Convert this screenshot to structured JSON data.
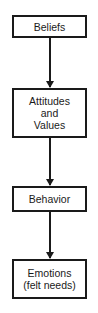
{
  "diagram": {
    "type": "flowchart",
    "direction": "top-to-bottom",
    "nodes": [
      {
        "id": "beliefs",
        "lines": [
          "Beliefs"
        ]
      },
      {
        "id": "attitudes-values",
        "lines": [
          "Attitudes",
          "and",
          "Values"
        ]
      },
      {
        "id": "behavior",
        "lines": [
          "Behavior"
        ]
      },
      {
        "id": "emotions",
        "lines": [
          "Emotions",
          "(felt needs)"
        ]
      }
    ],
    "edges": [
      {
        "from": "beliefs",
        "to": "attitudes-values"
      },
      {
        "from": "attitudes-values",
        "to": "behavior"
      },
      {
        "from": "behavior",
        "to": "emotions"
      }
    ],
    "colors": {
      "stroke": "#1a1a1a",
      "background": "#ffffff"
    }
  }
}
